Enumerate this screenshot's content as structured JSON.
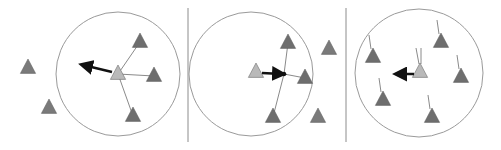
{
  "figure": {
    "colors": {
      "background": "#ffffff",
      "circle": "#9a9a9a",
      "divider": "#8c8c8c",
      "neighbor": "#6e6e6e",
      "outsider": "#7a7a7a",
      "focal": "#b9b9b9",
      "arrow": "#111111",
      "line": "#8a8a8a"
    },
    "dividers": [
      188,
      346
    ],
    "panels": [
      {
        "name": "separation",
        "circle": {
          "cx": 118,
          "cy": 74,
          "r": 62
        },
        "focal": {
          "x": 118,
          "y": 74
        },
        "neighbors": [
          {
            "x": 140,
            "y": 42
          },
          {
            "x": 154,
            "y": 76
          },
          {
            "x": 133,
            "y": 116
          }
        ],
        "outsiders": [
          {
            "x": 28,
            "y": 68
          },
          {
            "x": 49,
            "y": 108
          }
        ],
        "arrow": {
          "x1": 112,
          "y1": 72,
          "x2": 83,
          "y2": 65
        }
      },
      {
        "name": "cohesion",
        "circle": {
          "cx": 251,
          "cy": 74,
          "r": 62
        },
        "focal": {
          "x": 256,
          "y": 72
        },
        "neighbors": [
          {
            "x": 288,
            "y": 43
          },
          {
            "x": 305,
            "y": 78
          },
          {
            "x": 273,
            "y": 117
          }
        ],
        "outsiders": [
          {
            "x": 329,
            "y": 49
          },
          {
            "x": 318,
            "y": 117
          }
        ],
        "center_dot": {
          "x": 284,
          "y": 74
        },
        "arrow": {
          "x1": 262,
          "y1": 73,
          "x2": 282,
          "y2": 74
        }
      },
      {
        "name": "alignment",
        "circle": {
          "cx": 419,
          "cy": 73,
          "r": 64
        },
        "focal": {
          "x": 420,
          "y": 72
        },
        "neighbors": [
          {
            "x": 373,
            "y": 57
          },
          {
            "x": 441,
            "y": 42
          },
          {
            "x": 461,
            "y": 77
          },
          {
            "x": 383,
            "y": 100
          },
          {
            "x": 432,
            "y": 117
          }
        ],
        "arrow": {
          "x1": 414,
          "y1": 74,
          "x2": 397,
          "y2": 74
        }
      }
    ]
  }
}
